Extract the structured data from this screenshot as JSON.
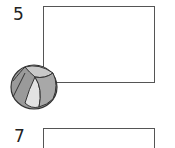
{
  "items": [
    {
      "number": "5",
      "answer": ""
    },
    {
      "number": "7",
      "answer": ""
    }
  ],
  "illustration": {
    "icon": "beach-ball-icon",
    "colors": {
      "dark": "#8a8a8a",
      "light": "#d6d6d6",
      "outline": "#333333"
    }
  }
}
